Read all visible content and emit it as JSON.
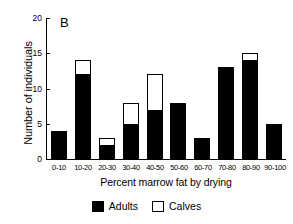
{
  "chart_data": {
    "type": "bar",
    "title": "",
    "panel_label": "B",
    "xlabel": "Percent marrow fat by drying",
    "ylabel": "Number of individuals",
    "grid": false,
    "stacked": true,
    "legend_position": "bottom",
    "ylim": [
      0,
      20
    ],
    "yticks": [
      0,
      5,
      10,
      15,
      20
    ],
    "ytick_labels": [
      "0",
      "5",
      "10",
      "15",
      "20"
    ],
    "categories": [
      "0-10",
      "10-20",
      "20-30",
      "30-40",
      "40-50",
      "50-60",
      "60-70",
      "70-80",
      "80-90",
      "90-100"
    ],
    "series": [
      {
        "name": "Adults",
        "color": "#000000",
        "values": [
          4,
          12,
          2,
          5,
          7,
          8,
          3,
          13,
          14,
          5
        ]
      },
      {
        "name": "Calves",
        "color": "#ffffff",
        "values": [
          0,
          2,
          1,
          3,
          5,
          0,
          0,
          0,
          1,
          0
        ]
      }
    ],
    "totals": [
      4,
      14,
      3,
      8,
      12,
      8,
      3,
      13,
      15,
      5
    ]
  },
  "legend": {
    "items": [
      {
        "label": "Adults",
        "swatch": "black-filled-square"
      },
      {
        "label": "Calves",
        "swatch": "white-outlined-square"
      }
    ]
  }
}
